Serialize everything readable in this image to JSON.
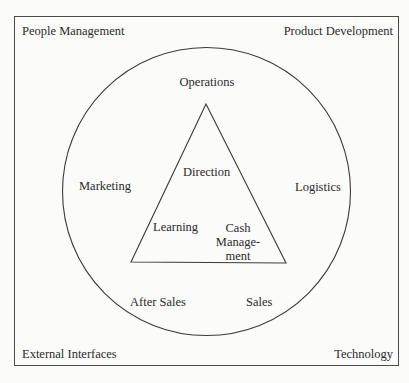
{
  "corners": {
    "top_left": "People Management",
    "top_right": "Product Development",
    "bottom_left": "External Interfaces",
    "bottom_right": "Technology"
  },
  "circle_labels": {
    "top": "Operations",
    "left": "Marketing",
    "right": "Logistics",
    "bottom_left": "After Sales",
    "bottom_right": "Sales"
  },
  "triangle_labels": {
    "top": "Direction",
    "bottom_left": "Learning",
    "bottom_right_line1": "Cash",
    "bottom_right_line2": "Manage-",
    "bottom_right_line3": "ment"
  },
  "colors": {
    "line": "#3a3a3a",
    "background": "#fbfbfa",
    "text": "#2a2a2a"
  }
}
